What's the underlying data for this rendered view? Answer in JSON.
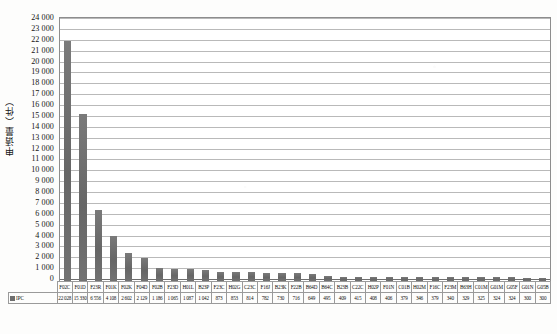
{
  "chart_data": {
    "type": "bar",
    "title": "",
    "xlabel": "",
    "ylabel": "申请量（件）",
    "ylim": [
      0,
      24000
    ],
    "ytick_step": 1000,
    "grid": true,
    "legend_position": "table-left",
    "legend_label": "IPC",
    "bar_color": "#6e6e6e",
    "yticks": [
      "24 000",
      "23 000",
      "22 000",
      "21 000",
      "20 000",
      "19 000",
      "18 000",
      "17 000",
      "16 000",
      "15 000",
      "14 000",
      "13 000",
      "12 000",
      "11 000",
      "10 000",
      "9 000",
      "8 000",
      "7 000",
      "6 000",
      "5 000",
      "4 000",
      "3 000",
      "2 000",
      "1 000",
      "0"
    ],
    "categories": [
      "F02C",
      "F01D",
      "F23R",
      "F01K",
      "F02K",
      "F04D",
      "F02B",
      "F23D",
      "H01L",
      "B23P",
      "F23C",
      "H02G",
      "C23C",
      "F16J",
      "B23K",
      "F22B",
      "B64D",
      "B64C",
      "B23B",
      "C22C",
      "H02P",
      "F01N",
      "C01B",
      "H02M",
      "F16C",
      "F23M",
      "B63H",
      "C01M",
      "G01M",
      "G05F",
      "G01N",
      "G05B"
    ],
    "values": [
      22028,
      15330,
      6556,
      4108,
      2602,
      2129,
      1186,
      1065,
      1087,
      1042,
      873,
      853,
      814,
      782,
      730,
      716,
      649,
      495,
      409,
      415,
      408,
      406,
      379,
      346,
      379,
      340,
      329,
      325,
      324,
      324,
      300,
      300
    ]
  },
  "figure": {
    "caption": ""
  }
}
